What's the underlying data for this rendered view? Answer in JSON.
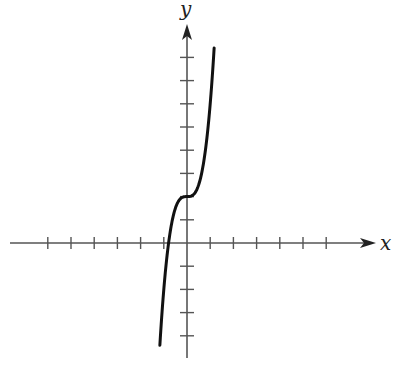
{
  "chart_data": {
    "type": "line",
    "title": "",
    "xlabel": "x",
    "ylabel": "y",
    "function": "y = 4x^3 + 2",
    "x_ticks": [
      -6,
      -5,
      -4,
      -3,
      -2,
      -1,
      1,
      2,
      3,
      4,
      5,
      6
    ],
    "y_ticks": [
      -4,
      -3,
      -2,
      -1,
      1,
      2,
      3,
      4,
      5,
      6,
      7,
      8
    ],
    "tick_labels_shown": false,
    "xlim": [
      -7.5,
      8.3
    ],
    "ylim": [
      -5.0,
      9.5
    ],
    "grid": false,
    "legend": null,
    "series": [
      {
        "name": "curve",
        "color": "#111111",
        "x": [
          -1.17,
          -1.0,
          -0.8,
          -0.6,
          -0.4,
          -0.2,
          0,
          0.2,
          0.4,
          0.6,
          0.8,
          1.0,
          1.17
        ],
        "y": [
          -4.41,
          -2.0,
          -0.05,
          1.14,
          1.74,
          1.97,
          2.0,
          2.03,
          2.26,
          2.86,
          4.05,
          6.0,
          8.41
        ]
      }
    ],
    "annotations": {
      "inflection_point": {
        "x": 0,
        "y": 2
      },
      "x_intercept": -0.79
    }
  },
  "labels": {
    "x_axis": "x",
    "y_axis": "y"
  },
  "style": {
    "axis_color": "#555555",
    "curve_color": "#111111"
  }
}
